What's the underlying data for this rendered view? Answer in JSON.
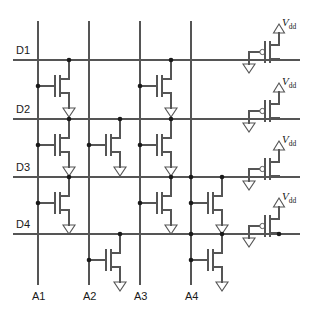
{
  "diagram": {
    "type": "circuit-schematic",
    "width": 309,
    "height": 312,
    "colors": {
      "wire": "#555555",
      "node": "#1a1a1a",
      "text": "#1a1a1a",
      "background": "#ffffff"
    },
    "geometry": {
      "column_x": [
        38,
        89,
        140,
        191
      ],
      "row_y": [
        60,
        119,
        177,
        234
      ],
      "col_top": 22,
      "col_bottom": 284,
      "row_left": 14,
      "row_right": 299
    },
    "row_labels": [
      {
        "text": "D1",
        "x": 16,
        "y": 54
      },
      {
        "text": "D2",
        "x": 16,
        "y": 113
      },
      {
        "text": "D3",
        "x": 16,
        "y": 171
      },
      {
        "text": "D4",
        "x": 16,
        "y": 228
      }
    ],
    "column_labels": [
      {
        "text": "A1",
        "x": 32,
        "y": 300
      },
      {
        "text": "A2",
        "x": 83,
        "y": 300
      },
      {
        "text": "A3",
        "x": 134,
        "y": 300
      },
      {
        "text": "A4",
        "x": 185,
        "y": 300
      }
    ],
    "supply_labels": [
      {
        "text_main": "V",
        "text_sub": "dd",
        "x": 282,
        "y": 26
      },
      {
        "text_main": "V",
        "text_sub": "dd",
        "x": 282,
        "y": 85
      },
      {
        "text_main": "V",
        "text_sub": "dd",
        "x": 282,
        "y": 143
      },
      {
        "text_main": "V",
        "text_sub": "dd",
        "x": 282,
        "y": 200
      }
    ],
    "nmos_cells": [
      {
        "row": "D1",
        "col": "A1",
        "gate_x": 38,
        "drain_y": 60,
        "tx": 55,
        "ty": 76
      },
      {
        "row": "D1",
        "col": "A3",
        "gate_x": 140,
        "drain_y": 60,
        "tx": 157,
        "ty": 76
      },
      {
        "row": "D2",
        "col": "A1",
        "gate_x": 38,
        "drain_y": 119,
        "tx": 55,
        "ty": 135
      },
      {
        "row": "D2",
        "col": "A2",
        "gate_x": 89,
        "drain_y": 119,
        "tx": 106,
        "ty": 135
      },
      {
        "row": "D2",
        "col": "A3",
        "gate_x": 140,
        "drain_y": 119,
        "tx": 157,
        "ty": 135
      },
      {
        "row": "D3",
        "col": "A1",
        "gate_x": 38,
        "drain_y": 177,
        "tx": 55,
        "ty": 193
      },
      {
        "row": "D3",
        "col": "A3",
        "gate_x": 140,
        "drain_y": 177,
        "tx": 157,
        "ty": 193
      },
      {
        "row": "D3",
        "col": "A4",
        "gate_x": 191,
        "drain_y": 177,
        "tx": 208,
        "ty": 193
      },
      {
        "row": "D4",
        "col": "A2",
        "gate_x": 89,
        "drain_y": 234,
        "tx": 106,
        "ty": 250
      },
      {
        "row": "D4",
        "col": "A4",
        "gate_x": 191,
        "drain_y": 234,
        "tx": 208,
        "ty": 250
      }
    ],
    "pmos_pullups": [
      {
        "row": "D1",
        "drain_y": 60,
        "tx": 265,
        "ty": 42,
        "gnd_x": 240
      },
      {
        "row": "D2",
        "drain_y": 119,
        "tx": 265,
        "ty": 101,
        "gnd_x": 240
      },
      {
        "row": "D3",
        "drain_y": 177,
        "tx": 265,
        "ty": 159,
        "gnd_x": 240
      },
      {
        "row": "D4",
        "drain_y": 234,
        "tx": 265,
        "ty": 216,
        "gnd_x": 240
      }
    ],
    "legend": {
      "nmos": "n-channel pull-down transistor",
      "pmos": "p-channel pull-up transistor (gate tied to ground)",
      "ground": "ground-symbol",
      "supply": "vdd-supply-arrow"
    }
  }
}
